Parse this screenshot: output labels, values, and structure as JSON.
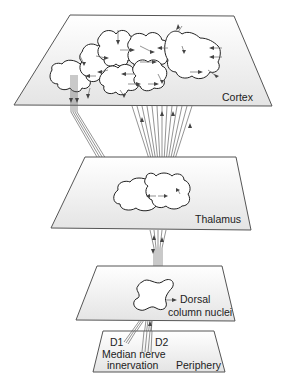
{
  "diagram": {
    "type": "somatosensory-pathway-layers",
    "layers": [
      {
        "id": "cortex",
        "label": "Cortex"
      },
      {
        "id": "thalamus",
        "label": "Thalamus"
      },
      {
        "id": "dorsal",
        "label_line1": "Dorsal",
        "label_line2": "column nuclei"
      },
      {
        "id": "periphery",
        "label": "Periphery"
      }
    ],
    "periphery_labels": {
      "d1": "D1",
      "d2": "D2",
      "median_line1": "Median nerve",
      "median_line2": "innervation"
    },
    "colors": {
      "plane_fill_top": "#ffffff",
      "plane_fill_bottom": "#e6e6e6",
      "outline": "#555555",
      "blob_stroke": "#222222",
      "fiber": "#666666"
    }
  }
}
